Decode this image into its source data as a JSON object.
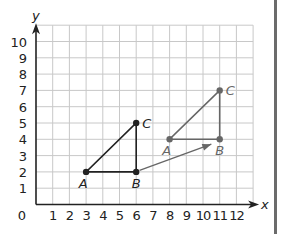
{
  "chart_data": {
    "type": "scatter",
    "title": "",
    "xlabel": "x",
    "ylabel": "y",
    "origin_label": "0",
    "xlim": [
      0,
      13
    ],
    "ylim": [
      0,
      11
    ],
    "grid": true,
    "x_ticks": [
      "1",
      "2",
      "3",
      "4",
      "5",
      "6",
      "7",
      "8",
      "9",
      "10",
      "11",
      "12"
    ],
    "y_ticks": [
      "1",
      "2",
      "3",
      "4",
      "5",
      "6",
      "7",
      "8",
      "9",
      "10"
    ],
    "series": [
      {
        "name": "Triangle ABC (original)",
        "color": "#222222",
        "points": [
          {
            "label": "A",
            "x": 3,
            "y": 2
          },
          {
            "label": "B",
            "x": 6,
            "y": 2
          },
          {
            "label": "C",
            "x": 6,
            "y": 5
          }
        ]
      },
      {
        "name": "Triangle ABC (translated)",
        "color": "#666666",
        "points": [
          {
            "label": "A",
            "x": 8,
            "y": 4
          },
          {
            "label": "B",
            "x": 11,
            "y": 4
          },
          {
            "label": "C",
            "x": 11,
            "y": 7
          }
        ]
      }
    ],
    "annotations": [
      {
        "type": "arrow",
        "from": [
          6.2,
          2.1
        ],
        "to": [
          10.5,
          3.7
        ],
        "color": "#666666",
        "meaning": "translation"
      }
    ]
  },
  "colors": {
    "grid": "#c8c8c8",
    "axis": "#222222",
    "original": "#222222",
    "image": "#666666",
    "side_bar": "#6b6b6b"
  }
}
